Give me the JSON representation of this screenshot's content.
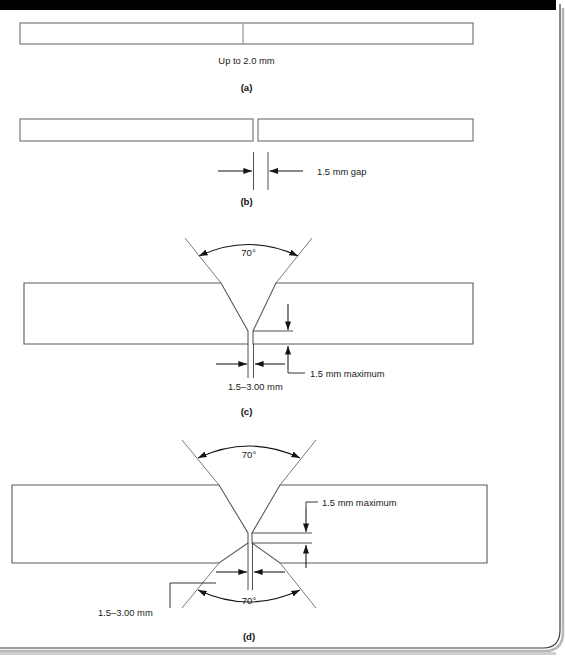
{
  "figure": {
    "page_background": "#ffffff",
    "line_color": "#6e6e6e",
    "dimension_color": "#141414",
    "top_bar_color": "#000000",
    "shadow_color": "#9a9a9a",
    "parts": [
      {
        "id": "a",
        "caption": "(a)",
        "type": "square-butt-closed",
        "labels": [
          {
            "name": "thickness-note",
            "text": "Up to 2.0 mm"
          }
        ]
      },
      {
        "id": "b",
        "caption": "(b)",
        "type": "square-butt-with-gap",
        "labels": [
          {
            "name": "gap-note",
            "text": "1.5 mm gap"
          }
        ]
      },
      {
        "id": "c",
        "caption": "(c)",
        "type": "single-v-butt",
        "labels": [
          {
            "name": "included-angle",
            "text": "70°"
          },
          {
            "name": "root-gap",
            "text": "1.5–3.00 mm"
          },
          {
            "name": "root-face",
            "text": "1.5 mm maximum"
          }
        ]
      },
      {
        "id": "d",
        "caption": "(d)",
        "type": "double-v-butt",
        "labels": [
          {
            "name": "included-angle-top",
            "text": "70°"
          },
          {
            "name": "included-angle-bottom",
            "text": "70°"
          },
          {
            "name": "root-gap",
            "text": "1.5–3.00 mm"
          },
          {
            "name": "root-face",
            "text": "1.5 mm maximum"
          }
        ]
      }
    ]
  },
  "labels": {
    "a_thickness": "Up to 2.0 mm",
    "a_caption": "(a)",
    "b_gap": "1.5 mm gap",
    "b_caption": "(b)",
    "c_angle": "70°",
    "c_root_gap": "1.5–3.00 mm",
    "c_root_face": "1.5 mm maximum",
    "c_caption": "(c)",
    "d_angle_top": "70°",
    "d_angle_bottom": "70°",
    "d_root_gap": "1.5–3.00 mm",
    "d_root_face": "1.5 mm maximum",
    "d_caption": "(d)"
  }
}
